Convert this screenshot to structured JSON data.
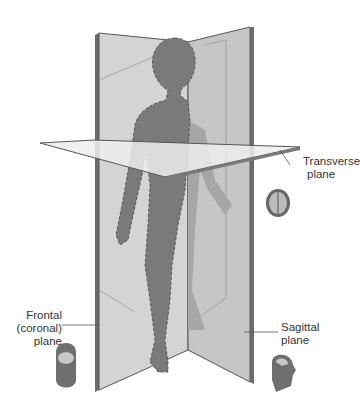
{
  "diagram": {
    "labels": {
      "transverse": {
        "line1": "Transverse",
        "line2": "plane"
      },
      "frontal": {
        "line1": "Frontal",
        "line2": "(coronal)",
        "line3": "plane"
      },
      "sagittal": {
        "line1": "Sagittal",
        "line2": "plane"
      }
    },
    "icons": {
      "transverse_head": "head-top-view-icon",
      "frontal_head": "head-front-section-icon",
      "sagittal_head": "head-side-section-icon"
    },
    "colors": {
      "plane_light": "#d6d6d6",
      "plane_mid": "#c2c2c2",
      "plane_edge": "#555555",
      "body": "#7a7a7a",
      "body_shadow": "#a8a8a8",
      "transverse": "#eeeeee"
    }
  }
}
